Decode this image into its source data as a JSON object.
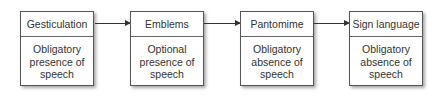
{
  "diagram": {
    "boxes": [
      {
        "title": "Gesticulation",
        "text": "Obligatory presence of speech"
      },
      {
        "title": "Emblems",
        "text": "Optional presence of speech"
      },
      {
        "title": "Pantomime",
        "text": "Obligatory absence of speech"
      },
      {
        "title": "Sign language",
        "text": "Obligatory absence of speech"
      }
    ],
    "connectors": [
      "arrow-right",
      "arrow-right",
      "arrow-right"
    ]
  }
}
